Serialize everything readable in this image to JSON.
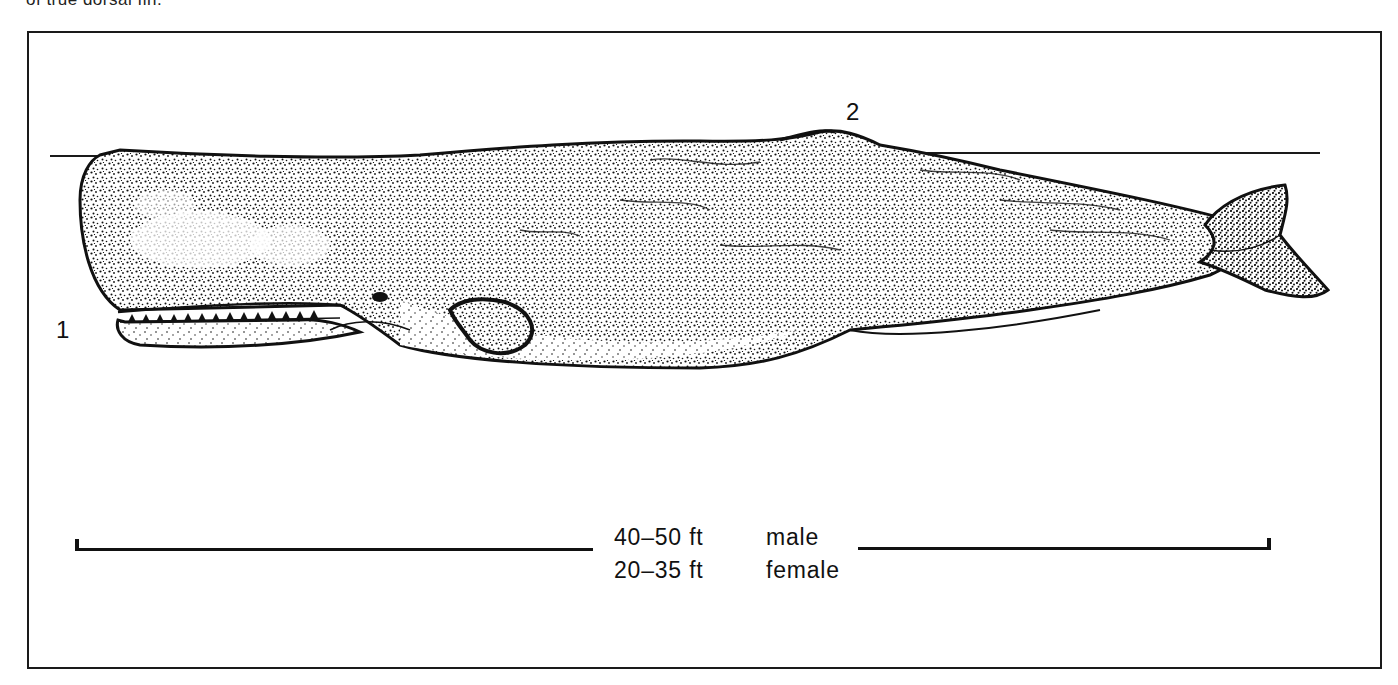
{
  "caption": {
    "fragment": "of true dorsal fin."
  },
  "figure": {
    "labels": [
      {
        "id": "1",
        "text": "1"
      },
      {
        "id": "2",
        "text": "2"
      }
    ],
    "size": {
      "male_length": "40–50 ft",
      "male_label": "male",
      "female_length": "20–35 ft",
      "female_label": "female"
    }
  }
}
